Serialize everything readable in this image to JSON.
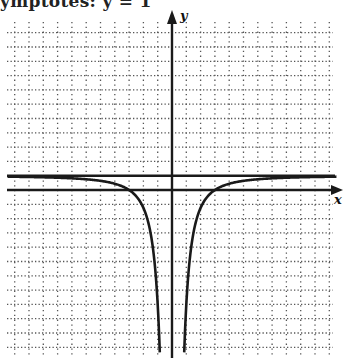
{
  "caption": "ymptotes:   y = 1",
  "chart_data": {
    "type": "line",
    "title": "",
    "xlabel": "x",
    "ylabel": "y",
    "function": "y = 1 - 9/x^2",
    "xlim": [
      -11.5,
      11.5
    ],
    "ylim": [
      -11.7,
      11.7
    ],
    "grid": true,
    "grid_style": "dotted",
    "asymptotes": {
      "horizontal": [
        1
      ],
      "vertical": [
        0
      ]
    },
    "x_intercepts": [
      -3,
      3
    ],
    "series": [
      {
        "name": "left-branch",
        "x": [
          -11.5,
          -8,
          -6,
          -4,
          -3,
          -2,
          -1.5,
          -1.2,
          -1,
          -0.84
        ],
        "y": [
          0.93,
          0.86,
          0.75,
          0.44,
          0,
          -1.25,
          -3,
          -5.25,
          -8,
          -11.7
        ]
      },
      {
        "name": "right-branch",
        "x": [
          0.84,
          1,
          1.2,
          1.5,
          2,
          3,
          4,
          6,
          8,
          11.5
        ],
        "y": [
          -11.7,
          -8,
          -5.25,
          -3,
          -1.25,
          0,
          0.44,
          0.75,
          0.86,
          0.93
        ]
      }
    ]
  },
  "layout": {
    "origin_px": [
      172,
      190
    ],
    "unit_px": 14.3,
    "grid_left": 7,
    "grid_right": 333,
    "grid_top": 22,
    "grid_bottom": 358
  },
  "colors": {
    "ink": "#1a1a1a",
    "grid": "#555555"
  }
}
